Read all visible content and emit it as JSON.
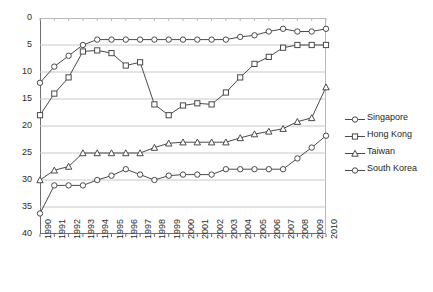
{
  "chart_data": {
    "type": "line",
    "title": "",
    "subtitle": "",
    "xlabel": "",
    "ylabel": "",
    "inverted_yaxis": true,
    "ylim": [
      0,
      40
    ],
    "ytick_step": 5,
    "yticks": [
      "0",
      "5",
      "10",
      "15",
      "20",
      "25",
      "30",
      "35",
      "40"
    ],
    "grid": "horizontal",
    "legend_position": "right",
    "x": [
      "1990",
      "1991",
      "1992",
      "1993",
      "1994",
      "1995",
      "1996",
      "1997",
      "1998",
      "1999",
      "2000",
      "2001",
      "2002",
      "2003",
      "2004",
      "2005",
      "2006",
      "2007",
      "2008",
      "2009",
      "2010"
    ],
    "series": [
      {
        "name": "Singapore",
        "marker": "circle",
        "color": "#4a4a4a",
        "values": [
          12.0,
          9.0,
          7.0,
          5.0,
          4.0,
          4.0,
          4.0,
          4.0,
          4.0,
          4.0,
          4.0,
          4.0,
          4.0,
          4.0,
          3.5,
          3.2,
          2.5,
          2.0,
          2.5,
          2.5,
          2.0
        ]
      },
      {
        "name": "Hong Kong",
        "marker": "square",
        "color": "#4a4a4a",
        "values": [
          18.0,
          14.0,
          11.0,
          6.2,
          6.0,
          6.5,
          8.8,
          8.2,
          16.0,
          18.0,
          16.2,
          15.8,
          16.0,
          13.8,
          11.0,
          8.5,
          7.2,
          5.5,
          5.0,
          5.0,
          5.0
        ]
      },
      {
        "name": "Taiwan",
        "marker": "triangle",
        "color": "#4a4a4a",
        "values": [
          30.0,
          28.2,
          27.5,
          25.0,
          25.0,
          25.0,
          25.0,
          25.0,
          24.0,
          23.2,
          23.0,
          23.0,
          23.0,
          23.0,
          22.2,
          21.5,
          21.0,
          20.5,
          19.2,
          18.5,
          12.8
        ]
      },
      {
        "name": "South Korea",
        "marker": "circle",
        "color": "#4a4a4a",
        "values": [
          36.2,
          31.0,
          31.0,
          31.0,
          30.0,
          29.2,
          28.0,
          29.0,
          30.0,
          29.2,
          29.0,
          29.0,
          29.0,
          28.0,
          28.0,
          28.0,
          28.0,
          28.0,
          26.0,
          24.0,
          21.8
        ]
      }
    ]
  },
  "legend": {
    "items": [
      {
        "label": "Singapore",
        "marker": "circle"
      },
      {
        "label": "Hong Kong",
        "marker": "square"
      },
      {
        "label": "Taiwan",
        "marker": "triangle"
      },
      {
        "label": "South Korea",
        "marker": "circle"
      }
    ]
  }
}
